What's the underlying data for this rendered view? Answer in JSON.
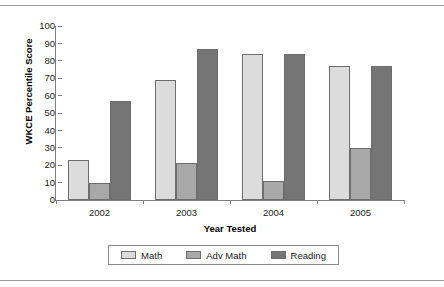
{
  "chart_data": {
    "type": "bar",
    "title": "",
    "xlabel": "Year Tested",
    "ylabel": "WKCE Percentile Score",
    "categories": [
      "2002",
      "2003",
      "2004",
      "2005"
    ],
    "series": [
      {
        "name": "Math",
        "values": [
          23,
          69,
          84,
          77
        ],
        "color": "#dcdcdc"
      },
      {
        "name": "Adv Math",
        "values": [
          10,
          21,
          11,
          30
        ],
        "color": "#a8a8a8"
      },
      {
        "name": "Reading",
        "values": [
          57,
          87,
          84,
          77
        ],
        "color": "#757575"
      }
    ],
    "ylim": [
      0,
      100
    ],
    "yticks": [
      0,
      10,
      20,
      30,
      40,
      50,
      60,
      70,
      80,
      90,
      100
    ],
    "ytick_labels": [
      "0",
      "10",
      "20",
      "30",
      "40",
      "50",
      "60",
      "70",
      "80",
      "90",
      "100"
    ],
    "grid": false,
    "legend_position": "bottom"
  }
}
